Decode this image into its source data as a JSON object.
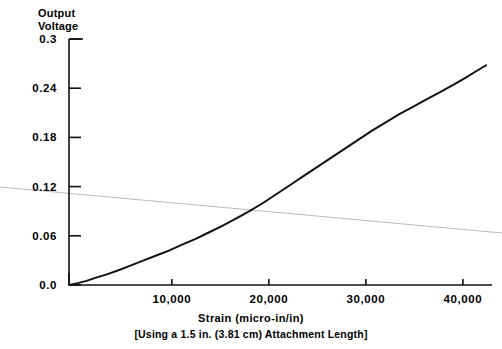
{
  "chart_data": {
    "type": "line",
    "title": "",
    "ylabel_line1": "Output",
    "ylabel_line2": "Voltage",
    "xlabel": "Strain   (micro-in/in)",
    "xlabel_note": "[Using a  1.5  in.  (3.81  cm)  Attachment  Length]",
    "xlim": [
      -600,
      43000
    ],
    "ylim": [
      0.0,
      0.3
    ],
    "grid": false,
    "legend": null,
    "xticks": [
      10000,
      20000,
      30000,
      40000
    ],
    "xtick_labels": [
      "10,000",
      "20,000",
      "30,000",
      "40,000"
    ],
    "yticks": [
      0.0,
      0.06,
      0.12,
      0.18,
      0.24,
      0.3
    ],
    "ytick_labels": [
      "0.0",
      "0.06",
      "0.12",
      "0.18",
      "0.24",
      "0.3"
    ],
    "series": [
      {
        "name": "output-voltage",
        "color": "#111111",
        "width": 2.0,
        "x": [
          -600,
          200,
          1200,
          2200,
          3300,
          4500,
          5800,
          7100,
          8400,
          9700,
          11000,
          12400,
          13800,
          15200,
          16600,
          18000,
          19400,
          20800,
          22200,
          23600,
          25000,
          26400,
          27800,
          29200,
          30600,
          32000,
          33400,
          34800,
          36200,
          37600,
          39000,
          40300,
          41400,
          42400
        ],
        "y": [
          0.0,
          0.002,
          0.005,
          0.009,
          0.013,
          0.018,
          0.024,
          0.03,
          0.036,
          0.042,
          0.049,
          0.056,
          0.064,
          0.072,
          0.081,
          0.09,
          0.1,
          0.111,
          0.122,
          0.133,
          0.144,
          0.155,
          0.166,
          0.177,
          0.188,
          0.198,
          0.208,
          0.217,
          0.226,
          0.235,
          0.244,
          0.253,
          0.261,
          0.268
        ]
      }
    ],
    "artifact_line": {
      "name": "scan-fold-line",
      "color": "#b9b9b9",
      "width": 1.0,
      "x_px": [
        0,
        502
      ],
      "y_px": [
        187,
        233
      ]
    },
    "axis_geometry": {
      "left_px": 69,
      "right_px": 492,
      "top_px": 39,
      "bottom_px": 285,
      "top_cap_px": 14,
      "left_cap_px": 12
    }
  }
}
